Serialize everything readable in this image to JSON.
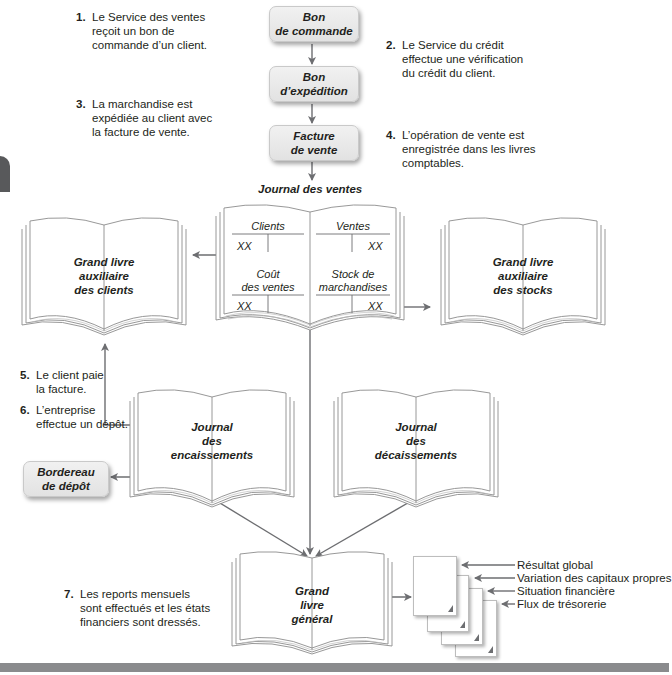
{
  "steps": [
    {
      "num": "1.",
      "text": "Le Service des ventes\nreçoit un bon de\ncommande d’un client."
    },
    {
      "num": "2.",
      "text": "Le Service du crédit\neffectue une vérification\ndu crédit du client."
    },
    {
      "num": "3.",
      "text": "La marchandise est\nexpédiée au client avec\nla facture de vente."
    },
    {
      "num": "4.",
      "text": "L’opération de vente est\nenregistrée dans les livres\ncomptables."
    },
    {
      "num": "5.",
      "text": "Le client paie\nla facture."
    },
    {
      "num": "6.",
      "text": "L’entreprise\neffectue un dépôt."
    },
    {
      "num": "7.",
      "text": "Les reports mensuels\nsont effectués et les états\nfinanciers sont dressés."
    }
  ],
  "documents": {
    "bon_commande": "Bon\nde commande",
    "bon_expedition": "Bon\nd’expédition",
    "facture_vente": "Facture\nde vente",
    "bordereau_depot": "Bordereau\nde dépôt"
  },
  "journal_ventes": {
    "title": "Journal des ventes",
    "accounts": {
      "clients": "Clients",
      "ventes": "Ventes",
      "cout_ventes": "Coût\ndes ventes",
      "stock_marchandises": "Stock de\nmarchandises"
    },
    "amount_placeholder": "XX"
  },
  "books": {
    "gl_aux_clients": "Grand livre\nauxiliaire\ndes clients",
    "gl_aux_stocks": "Grand livre\nauxiliaire\ndes stocks",
    "journal_encaissements": "Journal\ndes\nencaissements",
    "journal_decaissements": "Journal\ndes\ndécaissements",
    "grand_livre_general": "Grand\nlivre\ngénéral"
  },
  "financial_statements": [
    "Résultat global",
    "Variation des capitaux propres",
    "Situation financière",
    "Flux de trésorerie"
  ],
  "colors": {
    "arrow": "#6d6e71",
    "box_fill": "#e8e8e8",
    "tab_marker": "#58595b",
    "bottom_bar": "#8a8b8d"
  }
}
